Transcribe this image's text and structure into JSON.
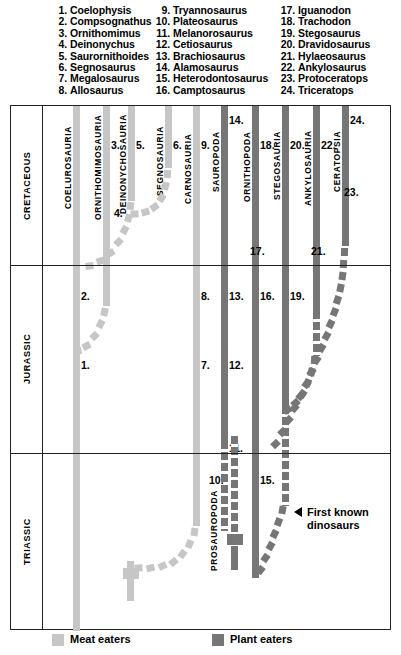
{
  "key_list": {
    "columns": [
      [
        {
          "num": "1.",
          "name": "Coelophysis"
        },
        {
          "num": "2.",
          "name": "Compsognathus"
        },
        {
          "num": "3.",
          "name": "Ornithomimus"
        },
        {
          "num": "4.",
          "name": "Deinonychus"
        },
        {
          "num": "5.",
          "name": "Saurornithoides"
        },
        {
          "num": "6.",
          "name": "Segnosaurus"
        },
        {
          "num": "7.",
          "name": "Megalosaurus"
        },
        {
          "num": "8.",
          "name": "Allosaurus"
        }
      ],
      [
        {
          "num": "9.",
          "name": "Tryannosaurus"
        },
        {
          "num": "10.",
          "name": "Plateosaurus"
        },
        {
          "num": "11.",
          "name": "Melanorosaurus"
        },
        {
          "num": "12.",
          "name": "Cetiosaurus"
        },
        {
          "num": "13.",
          "name": "Brachiosaurus"
        },
        {
          "num": "14.",
          "name": "Alamosaurus"
        },
        {
          "num": "15.",
          "name": "Heterodontosaurus"
        },
        {
          "num": "16.",
          "name": "Camptosaurus"
        }
      ],
      [
        {
          "num": "17.",
          "name": "Iguanodon"
        },
        {
          "num": "18.",
          "name": "Trachodon"
        },
        {
          "num": "19.",
          "name": "Stegosaurus"
        },
        {
          "num": "20.",
          "name": "Dravidosaurus"
        },
        {
          "num": "21.",
          "name": "Hylaeosaurus"
        },
        {
          "num": "22.",
          "name": "Ankylosaurus"
        },
        {
          "num": "23.",
          "name": "Protoceratops"
        },
        {
          "num": "24.",
          "name": "Triceratops"
        }
      ]
    ]
  },
  "periods": [
    {
      "label": "CRETACEOUS"
    },
    {
      "label": "JURASSIC"
    },
    {
      "label": "TRIASSIC"
    }
  ],
  "groups": [
    {
      "label": "COELUROSAURIA",
      "diet": "meat"
    },
    {
      "label": "ORNITHOMIMOSAURIA",
      "diet": "meat"
    },
    {
      "label": "DEINONYCHOSAURIA",
      "diet": "meat"
    },
    {
      "label": "SEGNOSAURIA",
      "diet": "meat"
    },
    {
      "label": "CARNOSAURIA",
      "diet": "meat"
    },
    {
      "label": "SAUROPODA",
      "diet": "plant"
    },
    {
      "label": "ORNITHOPODA",
      "diet": "plant"
    },
    {
      "label": "STEGOSAURIA",
      "diet": "plant"
    },
    {
      "label": "ANKYLOSAURIA",
      "diet": "plant"
    },
    {
      "label": "CERATOPSIA",
      "diet": "plant"
    },
    {
      "label": "PROSAUROPODA",
      "diet": "plant"
    }
  ],
  "markers": [
    {
      "id": "1."
    },
    {
      "id": "2."
    },
    {
      "id": "3."
    },
    {
      "id": "4."
    },
    {
      "id": "5."
    },
    {
      "id": "6."
    },
    {
      "id": "7."
    },
    {
      "id": "8."
    },
    {
      "id": "9."
    },
    {
      "id": "10."
    },
    {
      "id": "11."
    },
    {
      "id": "12."
    },
    {
      "id": "13."
    },
    {
      "id": "14."
    },
    {
      "id": "15."
    },
    {
      "id": "16."
    },
    {
      "id": "17."
    },
    {
      "id": "18."
    },
    {
      "id": "19."
    },
    {
      "id": "20."
    },
    {
      "id": "21."
    },
    {
      "id": "22."
    },
    {
      "id": "23."
    },
    {
      "id": "24."
    }
  ],
  "annotation": {
    "line1": "First known",
    "line2": "dinosaurs"
  },
  "legend": {
    "meat_label": "Meat eaters",
    "plant_label": "Plant eaters",
    "meat_color": "#c6c6c6",
    "plant_color": "#767676"
  },
  "chart_data": {
    "type": "line",
    "xlabel": "",
    "ylabel": "Geologic period",
    "grid": false,
    "legend_position": "bottom",
    "categories": [
      "COELUROSAURIA",
      "ORNITHOMIMOSAURIA",
      "DEINONYCHOSAURIA",
      "SEGNOSAURIA",
      "CARNOSAURIA",
      "SAUROPODA",
      "ORNITHOPODA",
      "STEGOSAURIA",
      "ANKYLOSAURIA",
      "CERATOPSIA",
      "PROSAUROPODA"
    ],
    "tick_labels": [
      "TRIASSIC",
      "JURASSIC",
      "CRETACEOUS"
    ],
    "series": [
      {
        "name": "COELUROSAURIA",
        "diet": "meat",
        "range": [
          "Triassic",
          "Cretaceous"
        ],
        "taxa": [
          "1. Coelophysis",
          "2. Compsognathus"
        ]
      },
      {
        "name": "ORNITHOMIMOSAURIA",
        "diet": "meat",
        "range": [
          "Cretaceous",
          "Cretaceous"
        ],
        "taxa": [
          "3. Ornithomimus"
        ]
      },
      {
        "name": "DEINONYCHOSAURIA",
        "diet": "meat",
        "range": [
          "Cretaceous",
          "Cretaceous"
        ],
        "taxa": [
          "4. Deinonychus",
          "5. Saurornithoides"
        ]
      },
      {
        "name": "SEGNOSAURIA",
        "diet": "meat",
        "range": [
          "Cretaceous",
          "Cretaceous"
        ],
        "taxa": [
          "6. Segnosaurus"
        ]
      },
      {
        "name": "CARNOSAURIA",
        "diet": "meat",
        "range": [
          "Triassic",
          "Cretaceous"
        ],
        "taxa": [
          "7. Megalosaurus",
          "8. Allosaurus",
          "9. Tryannosaurus"
        ]
      },
      {
        "name": "SAUROPODA",
        "diet": "plant",
        "range": [
          "Jurassic",
          "Cretaceous"
        ],
        "taxa": [
          "11. Melanorosaurus",
          "12. Cetiosaurus",
          "13. Brachiosaurus",
          "14. Alamosaurus"
        ]
      },
      {
        "name": "PROSAUROPODA",
        "diet": "plant",
        "range": [
          "Triassic",
          "Jurassic"
        ],
        "taxa": [
          "10. Plateosaurus"
        ]
      },
      {
        "name": "ORNITHOPODA",
        "diet": "plant",
        "range": [
          "Triassic",
          "Cretaceous"
        ],
        "taxa": [
          "15. Heterodontosaurus",
          "16. Camptosaurus",
          "17. Iguanodon",
          "18. Trachodon"
        ]
      },
      {
        "name": "STEGOSAURIA",
        "diet": "plant",
        "range": [
          "Jurassic",
          "Cretaceous"
        ],
        "taxa": [
          "19. Stegosaurus",
          "20. Dravidosaurus"
        ]
      },
      {
        "name": "ANKYLOSAURIA",
        "diet": "plant",
        "range": [
          "Jurassic",
          "Cretaceous"
        ],
        "taxa": [
          "21. Hylaeosaurus",
          "22. Ankylosaurus"
        ]
      },
      {
        "name": "CERATOPSIA",
        "diet": "plant",
        "range": [
          "Cretaceous",
          "Cretaceous"
        ],
        "taxa": [
          "23. Protoceratops",
          "24. Triceratops"
        ]
      }
    ]
  }
}
